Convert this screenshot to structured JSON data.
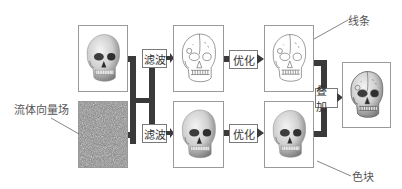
{
  "diagram": {
    "type": "pipeline",
    "labels": {
      "lines": "线条",
      "vector_field": "流体向量场",
      "color_blocks": "色块"
    },
    "operations": {
      "filter_top": "滤波",
      "filter_bottom": "滤波",
      "optimize_top": "优化",
      "optimize_bottom": "优化",
      "overlay": "叠加"
    },
    "images": [
      {
        "id": "input-skull",
        "desc": "shaded skull photo"
      },
      {
        "id": "noise-field",
        "desc": "fluid vector field noise texture"
      },
      {
        "id": "filtered-lines",
        "desc": "line-art skull"
      },
      {
        "id": "optimized-lines",
        "desc": "refined line-art skull"
      },
      {
        "id": "filtered-color",
        "desc": "shaded skull color blocks"
      },
      {
        "id": "optimized-color",
        "desc": "refined shaded skull"
      },
      {
        "id": "result",
        "desc": "combined line + color skull"
      }
    ],
    "colors": {
      "connector": "#3a3a3a",
      "box_border": "#9a9a9a",
      "text": "#444444"
    }
  }
}
